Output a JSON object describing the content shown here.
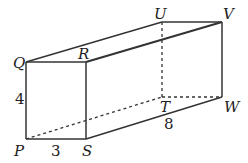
{
  "diagram": {
    "type": "rectangular prism",
    "vertices": {
      "P": {
        "label": "P"
      },
      "Q": {
        "label": "Q"
      },
      "R": {
        "label": "R"
      },
      "S": {
        "label": "S"
      },
      "T": {
        "label": "T"
      },
      "U": {
        "label": "U"
      },
      "V": {
        "label": "V"
      },
      "W": {
        "label": "W"
      }
    },
    "dimensions": {
      "height_PQ": "4",
      "width_PS": "3",
      "length_SW": "8"
    },
    "solid_edges": [
      "QR",
      "QP",
      "RS",
      "PS",
      "QU",
      "RV",
      "UV",
      "VW",
      "SW"
    ],
    "hidden_edges": [
      "PT",
      "TW",
      "UT"
    ],
    "colors": {
      "line": "#333333",
      "text": "#222222"
    }
  }
}
